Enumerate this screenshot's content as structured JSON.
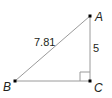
{
  "diagram": {
    "type": "right-triangle",
    "vertices": [
      {
        "name": "A",
        "x": 90,
        "y": 16
      },
      {
        "name": "B",
        "x": 15,
        "y": 81
      },
      {
        "name": "C",
        "x": 90,
        "y": 81
      }
    ],
    "labels": {
      "A": "A",
      "B": "B",
      "C": "C",
      "hypotenuse_AB": "7.81",
      "side_AC": "5"
    },
    "right_angle_at": "C",
    "colors": {
      "line": "#9a9a9a",
      "point": "#000000",
      "text": "#231f20"
    }
  }
}
